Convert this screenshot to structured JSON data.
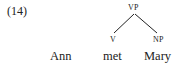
{
  "example": {
    "number": "(14)"
  },
  "tree": {
    "root": "VP",
    "children": [
      "V",
      "NP"
    ]
  },
  "sentence": {
    "words": [
      "Ann",
      "met",
      "Mary"
    ]
  }
}
